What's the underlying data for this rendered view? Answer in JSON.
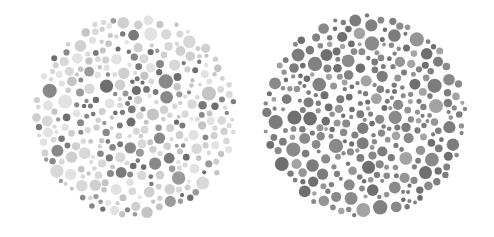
{
  "figure": {
    "background": "#ffffff"
  },
  "plates": [
    {
      "id": "left",
      "label": "Plate 1 (light background dots)",
      "cx": 135,
      "cy": 116,
      "r": 103,
      "seed": 17,
      "palette": [
        "#d8d8d8",
        "#cfcfcf",
        "#c4c4c4",
        "#e2e2e2",
        "#7a7a7a",
        "#888888",
        "#6e6e6e",
        "#9a9a9a"
      ],
      "weights": [
        3,
        3,
        2,
        2,
        2,
        1.5,
        1.2,
        1
      ]
    },
    {
      "id": "right",
      "label": "Plate 2 (dark background dots)",
      "cx": 365,
      "cy": 116,
      "r": 103,
      "seed": 41,
      "palette": [
        "#7c7c7c",
        "#8a8a8a",
        "#6f6f6f",
        "#959595",
        "#a3a3a3",
        "#818181"
      ],
      "weights": [
        3,
        3,
        2.5,
        2,
        1,
        2
      ]
    }
  ]
}
